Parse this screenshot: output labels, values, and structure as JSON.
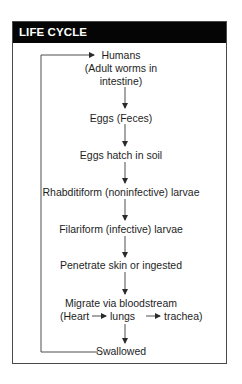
{
  "header": {
    "title": "LIFE CYCLE"
  },
  "nodes": [
    {
      "line1": "Humans",
      "line2": "(Adult worms in",
      "line3": "intestine)"
    },
    {
      "line1": "Eggs (Feces)"
    },
    {
      "line1": "Eggs hatch in soil"
    },
    {
      "line1": "Rhabditiform (noninfective) larvae"
    },
    {
      "line1": "Filariform (infective) larvae"
    },
    {
      "line1": "Penetrate skin or ingested"
    },
    {
      "line1": "Migrate via bloodstream",
      "line2a": "(Heart",
      "line2b": "lungs",
      "line2c": "trachea)"
    },
    {
      "line1": "Swallowed"
    }
  ],
  "colors": {
    "header_bg": "#050505",
    "header_text": "#ffffff",
    "line": "#3a3a3a"
  }
}
